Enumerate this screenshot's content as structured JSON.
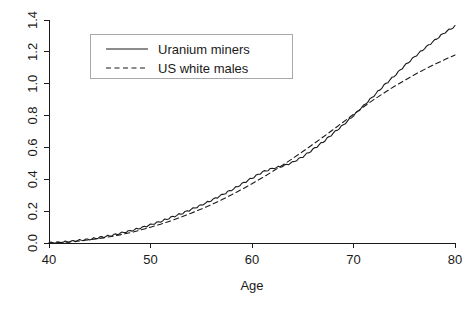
{
  "chart_data": {
    "type": "line",
    "title": "",
    "xlabel": "Age",
    "ylabel": "",
    "xlim": [
      40,
      80
    ],
    "ylim": [
      0,
      1.4
    ],
    "xticks": [
      "40",
      "50",
      "60",
      "70",
      "80"
    ],
    "xtick_values": [
      40,
      50,
      60,
      70,
      80
    ],
    "yticks": [
      "0.0",
      "0.2",
      "0.4",
      "0.6",
      "0.8",
      "1.0",
      "1.2",
      "1.4"
    ],
    "ytick_values": [
      0.0,
      0.2,
      0.4,
      0.6,
      0.8,
      1.0,
      1.2,
      1.4
    ],
    "grid": false,
    "legend_position": "top-left",
    "x": [
      40,
      41,
      42,
      43,
      44,
      45,
      46,
      47,
      48,
      49,
      50,
      51,
      52,
      53,
      54,
      55,
      56,
      57,
      58,
      59,
      60,
      61,
      62,
      63,
      64,
      65,
      66,
      67,
      68,
      69,
      70,
      71,
      72,
      73,
      74,
      75,
      76,
      77,
      78,
      79,
      80
    ],
    "series": [
      {
        "name": "Uranium miners",
        "style": "solid",
        "color": "#1a1a1a",
        "values": [
          0.0,
          0.004,
          0.009,
          0.016,
          0.024,
          0.034,
          0.046,
          0.06,
          0.076,
          0.094,
          0.114,
          0.136,
          0.159,
          0.184,
          0.21,
          0.238,
          0.268,
          0.3,
          0.334,
          0.37,
          0.408,
          0.444,
          0.468,
          0.482,
          0.506,
          0.542,
          0.586,
          0.635,
          0.688,
          0.742,
          0.8,
          0.862,
          0.925,
          0.988,
          1.048,
          1.11,
          1.168,
          1.222,
          1.272,
          1.322,
          1.36
        ]
      },
      {
        "name": "US white males",
        "style": "dashed",
        "color": "#1a1a1a",
        "values": [
          0.0,
          0.003,
          0.007,
          0.013,
          0.02,
          0.029,
          0.039,
          0.051,
          0.065,
          0.081,
          0.099,
          0.118,
          0.139,
          0.162,
          0.187,
          0.213,
          0.241,
          0.271,
          0.303,
          0.337,
          0.372,
          0.409,
          0.448,
          0.488,
          0.53,
          0.574,
          0.619,
          0.665,
          0.712,
          0.76,
          0.808,
          0.855,
          0.9,
          0.942,
          0.982,
          1.02,
          1.056,
          1.09,
          1.122,
          1.152,
          1.18
        ]
      }
    ],
    "legend": [
      {
        "label": "Uranium miners",
        "style": "solid"
      },
      {
        "label": "US white males",
        "style": "dashed"
      }
    ]
  }
}
